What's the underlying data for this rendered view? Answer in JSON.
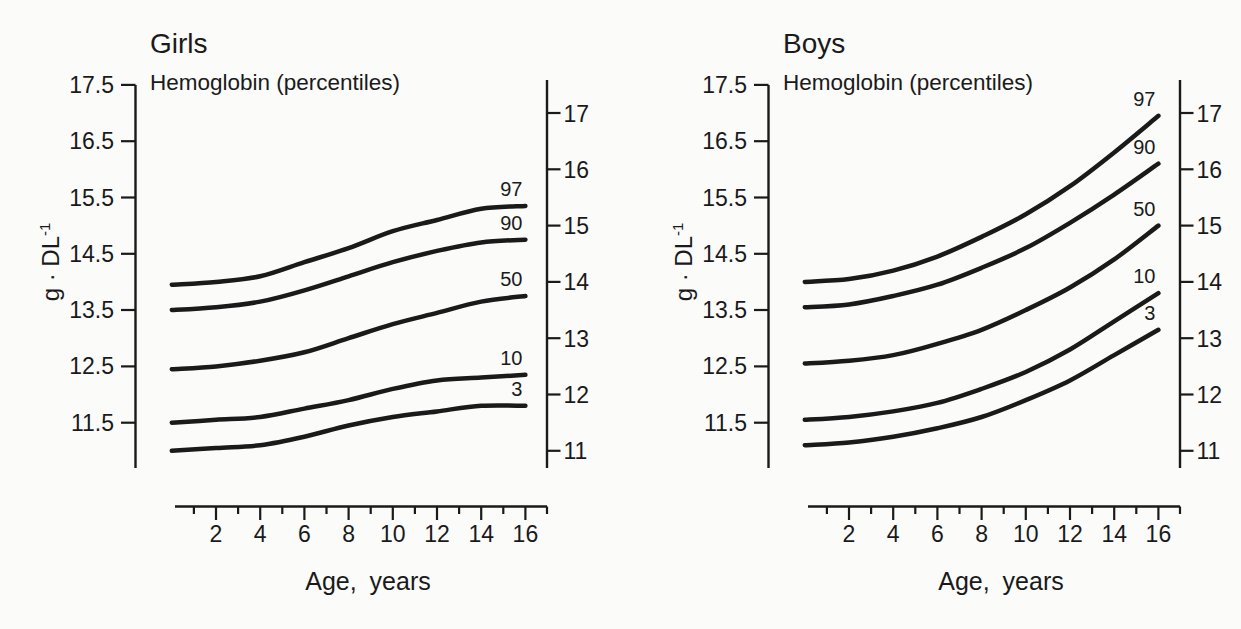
{
  "figure": {
    "background": "#fbfbfa",
    "ink": "#1a1a1a"
  },
  "chart_data": [
    {
      "type": "line",
      "id": "girls",
      "title": "Girls",
      "subtitle": "Hemoglobin (percentiles)",
      "ylabel_main": "g · DL",
      "ylabel_sup": "-1",
      "ylabel_text": "g · DL⁻¹",
      "xlabel": "Age, years",
      "x": [
        0,
        2,
        4,
        6,
        8,
        10,
        12,
        14,
        16
      ],
      "series": [
        {
          "name": "97",
          "values": [
            13.95,
            14.0,
            14.1,
            14.35,
            14.6,
            14.9,
            15.1,
            15.3,
            15.35
          ]
        },
        {
          "name": "90",
          "values": [
            13.5,
            13.55,
            13.65,
            13.85,
            14.1,
            14.35,
            14.55,
            14.7,
            14.75
          ]
        },
        {
          "name": "50",
          "values": [
            12.45,
            12.5,
            12.6,
            12.75,
            13.0,
            13.25,
            13.45,
            13.65,
            13.75
          ]
        },
        {
          "name": "10",
          "values": [
            11.5,
            11.55,
            11.6,
            11.75,
            11.9,
            12.1,
            12.25,
            12.3,
            12.35
          ]
        },
        {
          "name": "3",
          "values": [
            11.0,
            11.05,
            11.1,
            11.25,
            11.45,
            11.6,
            11.7,
            11.8,
            11.8
          ]
        }
      ],
      "left_axis_tick_labels": [
        "17.5",
        "16.5",
        "15.5",
        "14.5",
        "13.5",
        "12.5",
        "11.5"
      ],
      "right_axis_tick_labels": [
        "17",
        "16",
        "15",
        "14",
        "13",
        "12",
        "11"
      ],
      "x_tick_labels": [
        "2",
        "4",
        "6",
        "8",
        "10",
        "12",
        "14",
        "16"
      ],
      "x_minor_ticks": [
        1,
        3,
        5,
        7,
        9,
        11,
        13,
        15,
        17
      ],
      "ylim": [
        11,
        17.5
      ],
      "xlim": [
        0,
        17
      ],
      "grid": false
    },
    {
      "type": "line",
      "id": "boys",
      "title": "Boys",
      "subtitle": "Hemoglobin (percentiles)",
      "ylabel_main": "g · DL",
      "ylabel_sup": "-1",
      "ylabel_text": "g · DL⁻¹",
      "xlabel": "Age, years",
      "x": [
        0,
        2,
        4,
        6,
        8,
        10,
        12,
        14,
        16
      ],
      "series": [
        {
          "name": "97",
          "values": [
            14.0,
            14.05,
            14.2,
            14.45,
            14.8,
            15.2,
            15.7,
            16.3,
            16.95
          ]
        },
        {
          "name": "90",
          "values": [
            13.55,
            13.6,
            13.75,
            13.95,
            14.25,
            14.6,
            15.05,
            15.55,
            16.1
          ]
        },
        {
          "name": "50",
          "values": [
            12.55,
            12.6,
            12.7,
            12.9,
            13.15,
            13.5,
            13.9,
            14.4,
            15.0
          ]
        },
        {
          "name": "10",
          "values": [
            11.55,
            11.6,
            11.7,
            11.85,
            12.1,
            12.4,
            12.8,
            13.3,
            13.8
          ]
        },
        {
          "name": "3",
          "values": [
            11.1,
            11.15,
            11.25,
            11.4,
            11.6,
            11.9,
            12.25,
            12.7,
            13.15
          ]
        }
      ],
      "left_axis_tick_labels": [
        "17.5",
        "16.5",
        "15.5",
        "14.5",
        "13.5",
        "12.5",
        "11.5"
      ],
      "right_axis_tick_labels": [
        "17",
        "16",
        "15",
        "14",
        "13",
        "12",
        "11"
      ],
      "x_tick_labels": [
        "2",
        "4",
        "6",
        "8",
        "10",
        "12",
        "14",
        "16"
      ],
      "x_minor_ticks": [
        1,
        3,
        5,
        7,
        9,
        11,
        13,
        15,
        17
      ],
      "ylim": [
        11,
        17.5
      ],
      "xlim": [
        0,
        17
      ],
      "grid": false
    }
  ]
}
